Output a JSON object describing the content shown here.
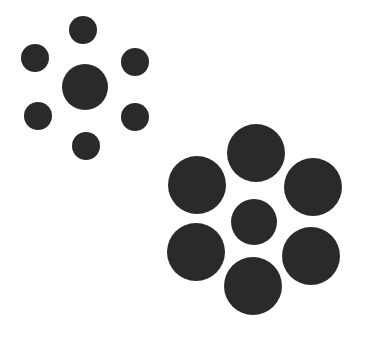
{
  "figure": {
    "width": 365,
    "height": 340,
    "background": "#ffffff",
    "fill": "#2a2a2a"
  },
  "groups": [
    {
      "name": "small-surround-group",
      "center": {
        "cx": 85,
        "cy": 87,
        "r": 23
      },
      "surround": [
        {
          "cx": 83,
          "cy": 30,
          "r": 14
        },
        {
          "cx": 35,
          "cy": 58,
          "r": 14
        },
        {
          "cx": 135,
          "cy": 62,
          "r": 14
        },
        {
          "cx": 38,
          "cy": 116,
          "r": 14
        },
        {
          "cx": 135,
          "cy": 117,
          "r": 14
        },
        {
          "cx": 86,
          "cy": 146,
          "r": 14
        }
      ]
    },
    {
      "name": "large-surround-group",
      "center": {
        "cx": 254,
        "cy": 222,
        "r": 23
      },
      "surround": [
        {
          "cx": 256,
          "cy": 153,
          "r": 29
        },
        {
          "cx": 197,
          "cy": 185,
          "r": 29
        },
        {
          "cx": 313,
          "cy": 187,
          "r": 29
        },
        {
          "cx": 196,
          "cy": 252,
          "r": 29
        },
        {
          "cx": 311,
          "cy": 256,
          "r": 29
        },
        {
          "cx": 253,
          "cy": 286,
          "r": 29
        }
      ]
    }
  ]
}
